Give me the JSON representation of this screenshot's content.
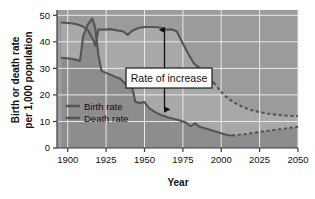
{
  "chart_data": {
    "type": "line",
    "title": "",
    "xlabel": "Year",
    "ylabel": "Birth or death rate per 1,000 population",
    "ylabel_line1": "Birth or death rate",
    "ylabel_line2": "per 1,000 population",
    "xlim": [
      1893,
      2050
    ],
    "ylim": [
      0,
      52
    ],
    "xticks": [
      1900,
      1925,
      1950,
      1975,
      2000,
      2025,
      2050
    ],
    "xtick_labels": [
      "1900",
      "1925",
      "1950",
      "1975",
      "2000",
      "2025",
      "2050"
    ],
    "yticks": [
      0,
      10,
      20,
      30,
      40,
      50
    ],
    "ytick_labels": [
      "0",
      "10",
      "20",
      "30",
      "40",
      "50"
    ],
    "grid": true,
    "legend_position": "inside-left",
    "legend": [
      "Birth rate",
      "Death rate"
    ],
    "annotations": [
      {
        "text": "Rate of increase",
        "x": 1963,
        "y_top": 44.5,
        "y_bottom": 14.5,
        "style": "double-headed-vertical-arrow-with-boxed-label"
      }
    ],
    "series": [
      {
        "name": "Birth rate",
        "color": "#555555",
        "solid_until": 1995,
        "dashed_from": 1995,
        "points": [
          [
            1896,
            47.3
          ],
          [
            1902,
            47.0
          ],
          [
            1906,
            46.6
          ],
          [
            1910,
            45.8
          ],
          [
            1913,
            44.5
          ],
          [
            1916,
            41.5
          ],
          [
            1918,
            38.5
          ],
          [
            1920,
            44.6
          ],
          [
            1924,
            44.6
          ],
          [
            1928,
            44.8
          ],
          [
            1932,
            44.3
          ],
          [
            1936,
            44.0
          ],
          [
            1939,
            42.6
          ],
          [
            1942,
            44.2
          ],
          [
            1946,
            45.2
          ],
          [
            1950,
            45.6
          ],
          [
            1955,
            45.6
          ],
          [
            1960,
            45.4
          ],
          [
            1964,
            44.6
          ],
          [
            1968,
            44.7
          ],
          [
            1971,
            44.0
          ],
          [
            1974,
            40.5
          ],
          [
            1978,
            36.0
          ],
          [
            1982,
            32.0
          ],
          [
            1986,
            30.0
          ],
          [
            1990,
            26.0
          ],
          [
            1991,
            24.5
          ],
          [
            1993,
            25.5
          ],
          [
            1995,
            24.6
          ],
          [
            1998,
            22.5
          ],
          [
            2001,
            20.5
          ],
          [
            2005,
            18.4
          ],
          [
            2010,
            16.6
          ],
          [
            2015,
            15.2
          ],
          [
            2020,
            14.2
          ],
          [
            2025,
            13.5
          ],
          [
            2030,
            13.0
          ],
          [
            2035,
            12.6
          ],
          [
            2040,
            12.3
          ],
          [
            2045,
            12.1
          ],
          [
            2050,
            12.0
          ]
        ]
      },
      {
        "name": "Death rate",
        "color": "#555555",
        "solid_until": 2007,
        "dashed_from": 2007,
        "points": [
          [
            1896,
            34.0
          ],
          [
            1902,
            33.6
          ],
          [
            1906,
            33.2
          ],
          [
            1908,
            32.8
          ],
          [
            1910,
            42.0
          ],
          [
            1913,
            46.5
          ],
          [
            1916,
            48.8
          ],
          [
            1918,
            45.0
          ],
          [
            1920,
            35.0
          ],
          [
            1922,
            29.0
          ],
          [
            1925,
            28.3
          ],
          [
            1928,
            27.6
          ],
          [
            1931,
            26.8
          ],
          [
            1934,
            26.2
          ],
          [
            1937,
            24.5
          ],
          [
            1940,
            23.0
          ],
          [
            1942,
            22.8
          ],
          [
            1944,
            17.4
          ],
          [
            1947,
            17.0
          ],
          [
            1950,
            17.3
          ],
          [
            1953,
            15.0
          ],
          [
            1957,
            13.5
          ],
          [
            1961,
            12.4
          ],
          [
            1965,
            11.6
          ],
          [
            1969,
            11.0
          ],
          [
            1973,
            10.4
          ],
          [
            1977,
            9.6
          ],
          [
            1980,
            8.2
          ],
          [
            1983,
            9.3
          ],
          [
            1986,
            8.0
          ],
          [
            1990,
            7.3
          ],
          [
            1994,
            6.6
          ],
          [
            1998,
            5.9
          ],
          [
            2002,
            5.2
          ],
          [
            2005,
            4.8
          ],
          [
            2007,
            4.7
          ],
          [
            2012,
            5.0
          ],
          [
            2017,
            5.3
          ],
          [
            2022,
            5.8
          ],
          [
            2028,
            6.3
          ],
          [
            2034,
            6.8
          ],
          [
            2040,
            7.2
          ],
          [
            2045,
            7.6
          ],
          [
            2050,
            8.0
          ]
        ]
      }
    ],
    "colors": {
      "plot_background": "#9b9b9b",
      "plot_background_below_birth": "#a8a8a8",
      "plot_background_below_death": "#8d8d8d",
      "gridline": "#e8e8e8",
      "line": "#575757",
      "axis": "#3a3a3a",
      "annotation_box_fill": "#ffffff",
      "annotation_box_border": "#1a1a1a",
      "text": "#111111",
      "page_background": "#ffffff"
    }
  }
}
